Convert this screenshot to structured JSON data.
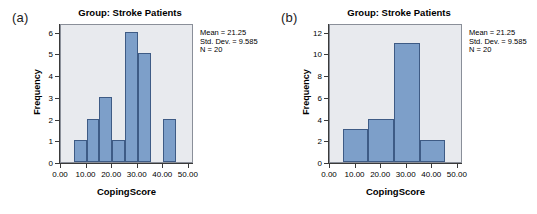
{
  "figure": {
    "panels": [
      {
        "letter": "(a)",
        "title": "Group: Stroke Patients",
        "xlabel": "CopingScore",
        "ylabel": "Frequency",
        "stats": {
          "mean": "Mean = 21.25",
          "std_dev": "Std. Dev. = 9.585",
          "n": "N = 20"
        }
      },
      {
        "letter": "(b)",
        "title": "Group: Stroke Patients",
        "xlabel": "CopingScore",
        "ylabel": "Frequency",
        "stats": {
          "mean": "Mean = 21.25",
          "std_dev": "Std. Dev. = 9.585",
          "n": "N = 20"
        }
      }
    ]
  },
  "chart_data": [
    {
      "type": "bar",
      "panel": "(a)",
      "title": "Group: Stroke Patients",
      "xlabel": "CopingScore",
      "ylabel": "Frequency",
      "xlim": [
        0,
        52
      ],
      "ylim": [
        0,
        6.4
      ],
      "xticks": [
        0,
        10,
        20,
        30,
        40,
        50
      ],
      "xtick_labels": [
        "0.00",
        "10.00",
        "20.00",
        "30.00",
        "40.00",
        "50.00"
      ],
      "yticks": [
        0,
        1,
        2,
        3,
        4,
        5,
        6
      ],
      "ytick_labels": [
        "0",
        "1",
        "2",
        "3",
        "4",
        "5",
        "6"
      ],
      "grid": false,
      "legend": null,
      "bin_width": 5,
      "bins": [
        {
          "start": 5,
          "end": 10,
          "count": 1
        },
        {
          "start": 10,
          "end": 15,
          "count": 2
        },
        {
          "start": 15,
          "end": 20,
          "count": 3
        },
        {
          "start": 20,
          "end": 25,
          "count": 1
        },
        {
          "start": 25,
          "end": 30,
          "count": 6
        },
        {
          "start": 30,
          "end": 35,
          "count": 5
        },
        {
          "start": 40,
          "end": 45,
          "count": 2
        }
      ],
      "annotations": [
        "Mean = 21.25",
        "Std. Dev. = 9.585",
        "N = 20"
      ],
      "colors": {
        "bar_fill": "#7d9fc9",
        "bar_edge": "#3e5b85",
        "plot_bg": "#e8eaee"
      }
    },
    {
      "type": "bar",
      "panel": "(b)",
      "title": "Group: Stroke Patients",
      "xlabel": "CopingScore",
      "ylabel": "Frequency",
      "xlim": [
        0,
        52
      ],
      "ylim": [
        0,
        12.8
      ],
      "xticks": [
        0,
        10,
        20,
        30,
        40,
        50
      ],
      "xtick_labels": [
        "0.00",
        "10.00",
        "20.00",
        "30.00",
        "40.00",
        "50.00"
      ],
      "yticks": [
        0,
        2,
        4,
        6,
        8,
        10,
        12
      ],
      "ytick_labels": [
        "0",
        "2",
        "4",
        "6",
        "8",
        "10",
        "12"
      ],
      "grid": false,
      "legend": null,
      "bin_width": 10,
      "bins": [
        {
          "start": 5,
          "end": 15,
          "count": 3
        },
        {
          "start": 15,
          "end": 25,
          "count": 4
        },
        {
          "start": 25,
          "end": 35,
          "count": 11
        },
        {
          "start": 35,
          "end": 45,
          "count": 2
        }
      ],
      "annotations": [
        "Mean = 21.25",
        "Std. Dev. = 9.585",
        "N = 20"
      ],
      "colors": {
        "bar_fill": "#7d9fc9",
        "bar_edge": "#3e5b85",
        "plot_bg": "#e8eaee"
      }
    }
  ]
}
